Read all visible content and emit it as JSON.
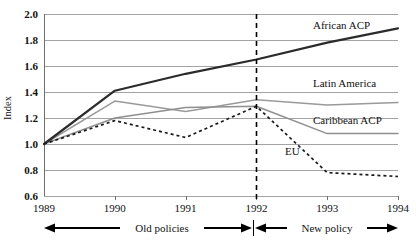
{
  "chart_data": {
    "type": "line",
    "title": "",
    "xlabel": "",
    "ylabel": "Index",
    "x": [
      1989,
      1990,
      1991,
      1992,
      1993,
      1994
    ],
    "xtick_labels": [
      "1989",
      "1990",
      "1991",
      "1992",
      "1993",
      "1994"
    ],
    "ytick_labels": [
      "0.6",
      "0.8",
      "1.0",
      "1.2",
      "1.4",
      "1.6",
      "1.8",
      "2.0"
    ],
    "yticks": [
      0.6,
      0.8,
      1.0,
      1.2,
      1.4,
      1.6,
      1.8,
      2.0
    ],
    "ylim": [
      0.6,
      2.0
    ],
    "xlim": [
      1989,
      1994
    ],
    "grid": "horizontal",
    "legend_position": "inline-right-labels",
    "series": [
      {
        "name": "African ACP",
        "style": "solid-thick-dark",
        "color": "#2b2b2b",
        "values": [
          1.0,
          1.41,
          1.54,
          1.65,
          1.78,
          1.89
        ]
      },
      {
        "name": "Latin America",
        "style": "solid-thin-gray",
        "color": "#9a9a9a",
        "values": [
          1.0,
          1.33,
          1.25,
          1.34,
          1.3,
          1.32
        ]
      },
      {
        "name": "Caribbean ACP",
        "style": "solid-thin-gray",
        "color": "#8f8f8f",
        "values": [
          1.0,
          1.2,
          1.28,
          1.29,
          1.08,
          1.08
        ]
      },
      {
        "name": "EU",
        "style": "dotted-dark",
        "color": "#1a1a1a",
        "values": [
          1.0,
          1.18,
          1.05,
          1.29,
          0.78,
          0.75
        ]
      }
    ],
    "annotations": [
      {
        "name": "policy-divider",
        "type": "vertical-dashed-line",
        "x": 1992
      },
      {
        "name": "old-policies-span",
        "type": "double-arrow",
        "label": "Old policies",
        "from": 1989,
        "to": 1992
      },
      {
        "name": "new-policy-span",
        "type": "double-arrow",
        "label": "New policy",
        "from": 1992,
        "to": 1994
      }
    ]
  },
  "series_labels": {
    "african": "African ACP",
    "latin": "Latin America",
    "caribbean": "Caribbean ACP",
    "eu": "EU"
  },
  "period_labels": {
    "old": "Old policies",
    "new": "New policy"
  },
  "axis": {
    "y_title": "Index"
  },
  "colors": {
    "african": "#2b2b2b",
    "latin": "#9a9a9a",
    "caribbean": "#8f8f8f",
    "eu": "#1a1a1a",
    "grid": "#8c8c8c",
    "axis": "#6e6e6e",
    "text": "#111111"
  }
}
